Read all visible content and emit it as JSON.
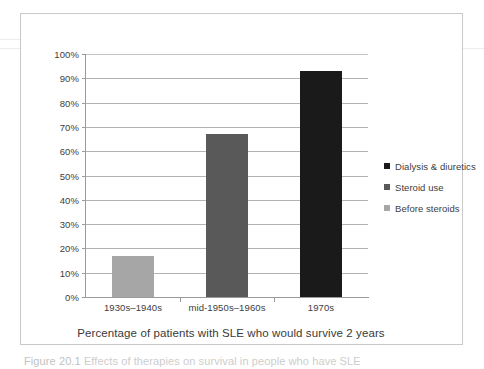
{
  "chart_data": {
    "type": "bar",
    "title": "",
    "subtitle": "",
    "xlabel": "Percentage of patients with SLE who would survive 2 years",
    "ylabel": "",
    "ylim": [
      0,
      100
    ],
    "grid": true,
    "legend_position": "right",
    "categories": [
      "1930s–1940s",
      "mid-1950s–1960s",
      "1970s"
    ],
    "values": [
      17,
      67,
      93
    ],
    "value_unit": "%",
    "ytick_labels": [
      "100%",
      "90%",
      "80%",
      "70%",
      "60%",
      "50%",
      "40%",
      "30%",
      "20%",
      "10%",
      "0%"
    ],
    "ytick_values": [
      100,
      90,
      80,
      70,
      60,
      50,
      40,
      30,
      20,
      10,
      0
    ],
    "series": [
      {
        "name": "Before steroids",
        "category": "1930s–1940s",
        "value": 17,
        "color": "#a6a6a6"
      },
      {
        "name": "Steroid use",
        "category": "mid-1950s–1960s",
        "value": 67,
        "color": "#595959"
      },
      {
        "name": "Dialysis & diuretics",
        "category": "1970s",
        "value": 93,
        "color": "#1a1a1a"
      }
    ],
    "legend": [
      {
        "label": "Dialysis & diuretics",
        "color": "#1a1a1a"
      },
      {
        "label": "Steroid use",
        "color": "#595959"
      },
      {
        "label": "Before steroids",
        "color": "#a6a6a6"
      }
    ]
  },
  "axis_title": "Percentage of patients with SLE who would survive 2 years",
  "caption": {
    "figure_number": "Figure 20.1",
    "text": "Effects of therapies on survival in people who have SLE"
  },
  "colors": {
    "bar_light": "#a6a6a6",
    "bar_medium": "#595959",
    "bar_dark": "#1a1a1a",
    "gridline": "#b3b3b3",
    "axis": "#9a9a9a",
    "frame": "#c9c9c9",
    "text": "#3d3d3d"
  }
}
